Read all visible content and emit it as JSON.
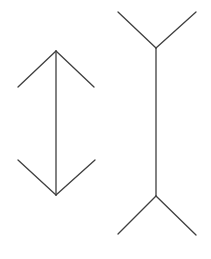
{
  "canvas": {
    "width": 211,
    "height": 259,
    "background_color": "#ffffff",
    "title": "Muller-Lyer illusion figure"
  },
  "style": {
    "line_color": "#3f3f3f",
    "line_width": 1.3,
    "line_cap": "round"
  },
  "chart_data": {
    "type": "diagram",
    "figures": [
      {
        "name": "left-figure",
        "label": "Arrowheads-in shaft",
        "fin_direction": "inward",
        "shaft": {
          "x": 56,
          "y1": 51,
          "y2": 195,
          "length": 144
        },
        "fins": [
          {
            "name": "top-left-fin",
            "x1": 56,
            "y1": 51,
            "x2": 18,
            "y2": 87
          },
          {
            "name": "top-right-fin",
            "x1": 56,
            "y1": 51,
            "x2": 94,
            "y2": 87
          },
          {
            "name": "bottom-left-fin",
            "x1": 56,
            "y1": 195,
            "x2": 18,
            "y2": 160
          },
          {
            "name": "bottom-right-fin",
            "x1": 56,
            "y1": 195,
            "x2": 95,
            "y2": 160
          }
        ]
      },
      {
        "name": "right-figure",
        "label": "Fins-out shaft",
        "fin_direction": "outward",
        "shaft": {
          "x": 156,
          "y1": 48,
          "y2": 196,
          "length": 148
        },
        "fins": [
          {
            "name": "top-left-fin",
            "x1": 156,
            "y1": 48,
            "x2": 118,
            "y2": 12
          },
          {
            "name": "top-right-fin",
            "x1": 156,
            "y1": 48,
            "x2": 196,
            "y2": 12
          },
          {
            "name": "bottom-left-fin",
            "x1": 156,
            "y1": 196,
            "x2": 118,
            "y2": 234
          },
          {
            "name": "bottom-right-fin",
            "x1": 156,
            "y1": 196,
            "x2": 196,
            "y2": 235
          }
        ]
      }
    ]
  }
}
